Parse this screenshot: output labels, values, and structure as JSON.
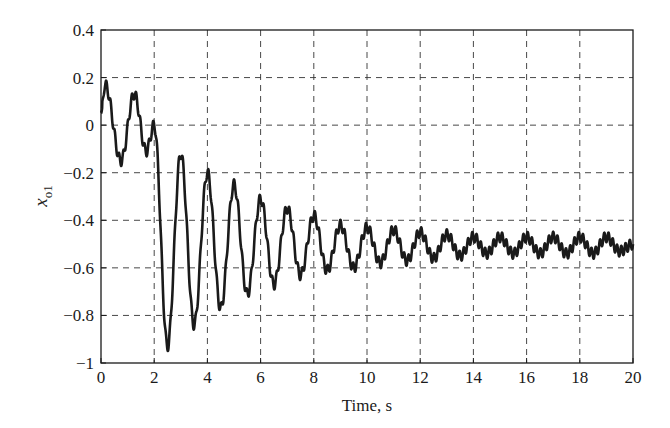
{
  "chart_data": {
    "type": "line",
    "title": "",
    "xlabel": "Time, s",
    "ylabel": "x_o1",
    "ylabel_main": "x",
    "ylabel_sub": "o1",
    "xlim": [
      0,
      20
    ],
    "ylim": [
      -1,
      0.4
    ],
    "xticks": [
      0,
      2,
      4,
      6,
      8,
      10,
      12,
      14,
      16,
      18,
      20
    ],
    "yticks": [
      -1,
      -0.8,
      -0.6,
      -0.4,
      -0.2,
      0,
      0.2,
      0.4
    ],
    "xtick_labels": [
      "0",
      "2",
      "4",
      "6",
      "8",
      "10",
      "12",
      "14",
      "16",
      "18",
      "20"
    ],
    "ytick_labels": [
      "−1",
      "−0.8",
      "−0.6",
      "−0.4",
      "−0.2",
      "0",
      "0.2",
      "0.4"
    ],
    "grid": true,
    "grid_style": "dashed",
    "legend": null,
    "line_color": "#1a1a1a",
    "series": [
      {
        "name": "x_o1",
        "description": "Damped oscillation settling near -0.5 with superimposed high-frequency ripple",
        "extrema": {
          "x": [
            0.0,
            0.15,
            0.75,
            1.25,
            1.7,
            2.0,
            2.5,
            3.0,
            3.5,
            4.0,
            4.5,
            5.0,
            5.5,
            6.0,
            6.5,
            7.0,
            7.5,
            8.0,
            8.5,
            9.0,
            9.5,
            10.0,
            10.5,
            11.0,
            11.5,
            12.0,
            12.5,
            13.0,
            13.5,
            14.0,
            14.5,
            15.0,
            15.5,
            16.0,
            16.5,
            17.0,
            17.5,
            18.0,
            18.5,
            19.0,
            19.5,
            20.0
          ],
          "y": [
            0.05,
            0.17,
            -0.15,
            0.13,
            -0.11,
            0.0,
            -0.93,
            -0.12,
            -0.84,
            -0.2,
            -0.77,
            -0.25,
            -0.71,
            -0.31,
            -0.67,
            -0.35,
            -0.63,
            -0.38,
            -0.61,
            -0.42,
            -0.6,
            -0.43,
            -0.58,
            -0.44,
            -0.57,
            -0.45,
            -0.56,
            -0.46,
            -0.55,
            -0.47,
            -0.54,
            -0.47,
            -0.54,
            -0.47,
            -0.54,
            -0.47,
            -0.54,
            -0.47,
            -0.54,
            -0.47,
            -0.53,
            -0.5
          ]
        },
        "ripple_amplitude": 0.022,
        "ripple_period": 0.16
      }
    ]
  }
}
